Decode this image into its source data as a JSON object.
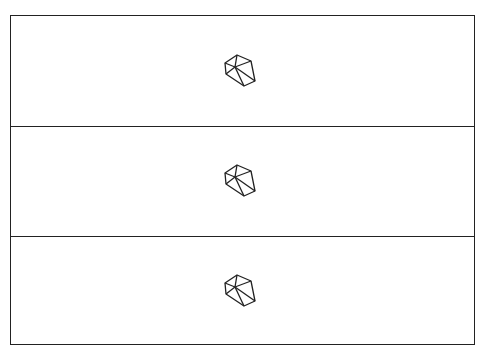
{
  "panels": [
    {
      "icon": "polyhedron-wireframe-icon"
    },
    {
      "icon": "polyhedron-wireframe-icon"
    },
    {
      "icon": "polyhedron-wireframe-icon"
    }
  ],
  "colors": {
    "line": "#222222",
    "background": "#ffffff"
  }
}
